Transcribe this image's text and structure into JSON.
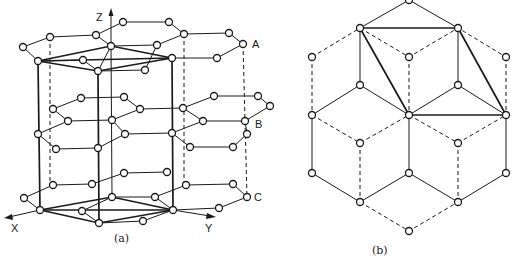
{
  "figure_a": {
    "caption": "(a)",
    "layer_labels": [
      "A",
      "B",
      "C"
    ],
    "axis_labels": {
      "x": "X",
      "y": "Y",
      "z": "Z"
    },
    "description": "Hexagonal layered lattice (stacking A-B-C) with unit cell prism outlined"
  },
  "figure_b": {
    "caption": "(b)",
    "description": "Projected hexagonal network with rhombic cells; solid and dashed bonds"
  },
  "colors": {
    "line": "#1a1a1a",
    "background": "#ffffff",
    "atom_fill": "#ffffff"
  }
}
